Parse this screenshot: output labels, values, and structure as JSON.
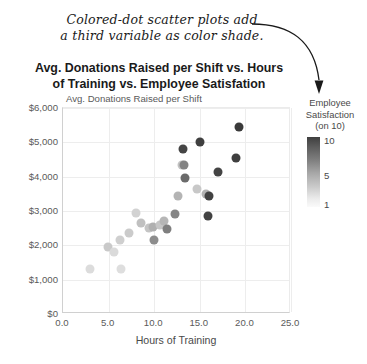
{
  "annotation": {
    "text": "Colored-dot scatter plots add\na third variable as color shade.",
    "arrow_icon": "curved-arrow-icon"
  },
  "chart_data": {
    "type": "scatter",
    "title": "Avg. Donations Raised per Shift vs. Hours\nof Training vs. Employee Satisfation",
    "xlabel": "Hours of Training",
    "ylabel": "Avg. Donations Raised per Shift",
    "ylabel_inline_prefix": "$6,000 Avg. Donations Raised per Shift",
    "xlim": [
      0.0,
      25.0
    ],
    "ylim": [
      0,
      6000
    ],
    "xticks": [
      "0.0",
      "5.0",
      "10.0",
      "15.0",
      "20.0",
      "25.0"
    ],
    "xtick_values": [
      0.0,
      5.0,
      10.0,
      15.0,
      20.0,
      25.0
    ],
    "yticks": [
      "$0",
      "$1,000",
      "$2,000",
      "$3,000",
      "$4,000",
      "$5,000",
      "$6,000"
    ],
    "ytick_values": [
      0,
      1000,
      2000,
      3000,
      4000,
      5000,
      6000
    ],
    "grid": true,
    "legend": {
      "title": "Employee\nSatisfaction\n(on 10)",
      "position": "right",
      "type": "colorbar-gradient",
      "scale_max_label": "10",
      "scale_mid_label": "5",
      "scale_min_label": "1",
      "scale_max_value": 10,
      "scale_mid_value": 5,
      "scale_min_value": 1,
      "color_dark": "#3f3f3f",
      "color_light": "#fafafa"
    },
    "color_variable": "Employee Satisfaction (on 10)",
    "points": [
      {
        "x": 3.0,
        "y": 1300,
        "c": 2,
        "color": "#dcdcdc"
      },
      {
        "x": 4.9,
        "y": 1950,
        "c": 3,
        "color": "#c9c9c9"
      },
      {
        "x": 5.6,
        "y": 1800,
        "c": 2,
        "color": "#dadada"
      },
      {
        "x": 6.3,
        "y": 2150,
        "c": 3,
        "color": "#cfcfcf"
      },
      {
        "x": 6.4,
        "y": 1300,
        "c": 2,
        "color": "#dedede"
      },
      {
        "x": 7.2,
        "y": 2350,
        "c": 3,
        "color": "#cbcbcb"
      },
      {
        "x": 8.0,
        "y": 2950,
        "c": 3,
        "color": "#d2d2d2"
      },
      {
        "x": 8.6,
        "y": 2650,
        "c": 4,
        "color": "#c0c0c0"
      },
      {
        "x": 9.4,
        "y": 2500,
        "c": 4,
        "color": "#c4c4c4"
      },
      {
        "x": 9.9,
        "y": 2520,
        "c": 5,
        "color": "#b0b0b0"
      },
      {
        "x": 10.0,
        "y": 2150,
        "c": 7,
        "color": "#8c8c8c"
      },
      {
        "x": 10.6,
        "y": 2600,
        "c": 4,
        "color": "#c6c6c6"
      },
      {
        "x": 11.1,
        "y": 2700,
        "c": 5,
        "color": "#b6b6b6"
      },
      {
        "x": 11.4,
        "y": 2480,
        "c": 7,
        "color": "#7f7f7f"
      },
      {
        "x": 12.3,
        "y": 2900,
        "c": 7,
        "color": "#858585"
      },
      {
        "x": 12.6,
        "y": 3450,
        "c": 5,
        "color": "#b4b4b4"
      },
      {
        "x": 13.0,
        "y": 4350,
        "c": 4,
        "color": "#c3c3c3"
      },
      {
        "x": 13.3,
        "y": 4350,
        "c": 7,
        "color": "#838383"
      },
      {
        "x": 13.2,
        "y": 4800,
        "c": 9,
        "color": "#454545"
      },
      {
        "x": 13.4,
        "y": 3950,
        "c": 8,
        "color": "#6b6b6b"
      },
      {
        "x": 14.7,
        "y": 3650,
        "c": 4,
        "color": "#c8c8c8"
      },
      {
        "x": 15.0,
        "y": 5000,
        "c": 9,
        "color": "#3f3f3f"
      },
      {
        "x": 15.7,
        "y": 3500,
        "c": 5,
        "color": "#b2b2b2"
      },
      {
        "x": 15.9,
        "y": 2850,
        "c": 9,
        "color": "#424242"
      },
      {
        "x": 16.0,
        "y": 3450,
        "c": 9,
        "color": "#424242"
      },
      {
        "x": 17.0,
        "y": 4150,
        "c": 9,
        "color": "#444444"
      },
      {
        "x": 19.0,
        "y": 4550,
        "c": 9,
        "color": "#3f3f3f"
      },
      {
        "x": 19.3,
        "y": 5450,
        "c": 10,
        "color": "#3a3a3a"
      }
    ]
  }
}
